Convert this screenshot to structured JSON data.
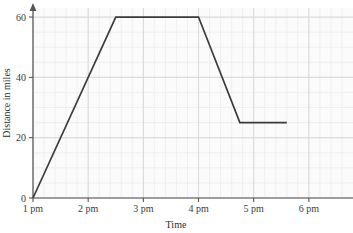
{
  "chart_data": {
    "type": "line",
    "title": "",
    "xlabel": "Time",
    "ylabel": "Distance in miles",
    "x_tick_labels": [
      "1 pm",
      "2 pm",
      "3 pm",
      "4 pm",
      "5 pm",
      "6 pm"
    ],
    "x_tick_values": [
      1,
      2,
      3,
      4,
      5,
      6
    ],
    "y_tick_labels": [
      "0",
      "20",
      "40",
      "60"
    ],
    "y_tick_values": [
      0,
      20,
      40,
      60
    ],
    "xlim": [
      1,
      6.8
    ],
    "ylim": [
      0,
      63
    ],
    "grid": true,
    "grid_minor_x_per_unit": 5,
    "grid_minor_y_step": 5,
    "legend": "none",
    "series": [
      {
        "name": "Distance travelled",
        "x": [
          1,
          2.5,
          4,
          4.75,
          5.6
        ],
        "y": [
          0,
          60,
          60,
          25,
          25
        ],
        "color": "#3b3b3b"
      }
    ],
    "annotations": []
  },
  "colors": {
    "line": "#3b3b3b",
    "axis": "#555555",
    "grid_major": "#d6d6d6",
    "grid_minor": "#e9e9e9",
    "plot_background": "#fbfbfb",
    "page_background": "#ffffff",
    "text": "#3a3a3a"
  }
}
